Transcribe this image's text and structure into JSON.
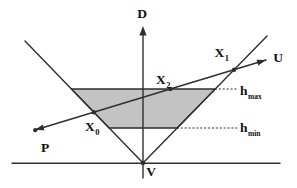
{
  "figure": {
    "background": "#ffffff",
    "line_color": "#2e2e2e",
    "text_color": "#111111",
    "region_fill": "#c3c3c3",
    "labels": {
      "d_axis": "D",
      "u_axis": "U",
      "p_axis": "P",
      "vertex": "V",
      "x0": {
        "base": "X",
        "sub": "0"
      },
      "x1": {
        "base": "X",
        "sub": "1"
      },
      "x2": {
        "base": "X",
        "sub": "2"
      },
      "h_max": {
        "base": "h",
        "sub": "max"
      },
      "h_min": {
        "base": "h",
        "sub": "min"
      }
    }
  }
}
